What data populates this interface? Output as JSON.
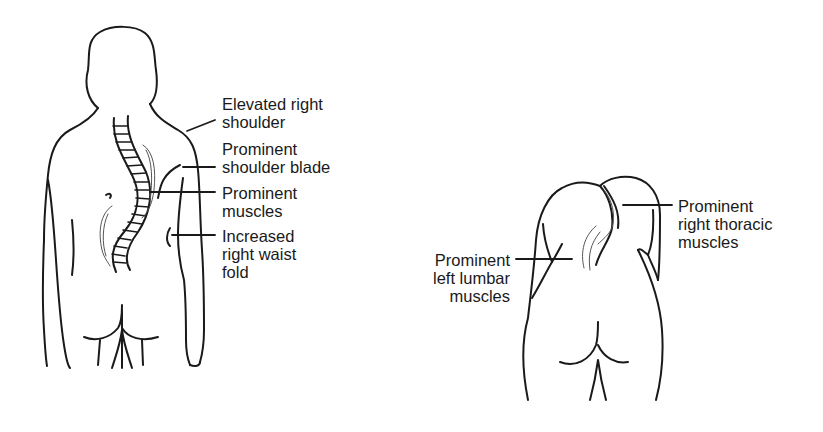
{
  "figure_left": {
    "description": "Standing back view showing scoliosis signs",
    "labels": [
      {
        "id": "elevated-shoulder",
        "lines": [
          "Elevated right",
          "shoulder"
        ]
      },
      {
        "id": "shoulder-blade",
        "lines": [
          "Prominent",
          "shoulder blade"
        ]
      },
      {
        "id": "prominent-muscles",
        "lines": [
          "Prominent",
          "muscles"
        ]
      },
      {
        "id": "waist-fold",
        "lines": [
          "Increased",
          "right waist",
          "fold"
        ]
      }
    ]
  },
  "figure_right": {
    "description": "Forward bend test view",
    "labels": [
      {
        "id": "thoracic-muscles",
        "lines": [
          "Prominent",
          "right thoracic",
          "muscles"
        ]
      },
      {
        "id": "lumbar-muscles",
        "lines": [
          "Prominent",
          "left lumbar",
          "muscles"
        ]
      }
    ]
  },
  "colors": {
    "line": "#1a1a1a",
    "background": "#ffffff"
  }
}
